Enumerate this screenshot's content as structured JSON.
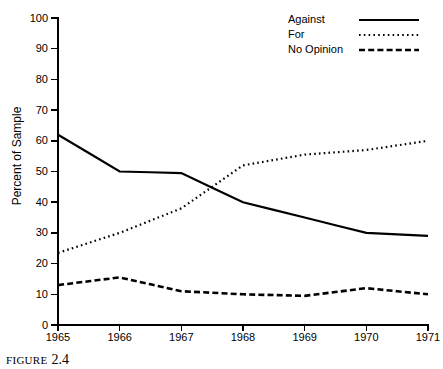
{
  "caption": {
    "word": "FIGURE",
    "number": "2.4"
  },
  "axes": {
    "ylabel": "Percent of Sample",
    "yticks": [
      "0",
      "10",
      "20",
      "30",
      "40",
      "50",
      "60",
      "70",
      "80",
      "90",
      "100"
    ],
    "xticks": [
      "1965",
      "1966",
      "1967",
      "1968",
      "1969",
      "1970",
      "1971"
    ]
  },
  "legend": {
    "items": [
      {
        "label": "Against",
        "style": "solid"
      },
      {
        "label": "For",
        "style": "dotted"
      },
      {
        "label": "No Opinion",
        "style": "dashed"
      }
    ]
  },
  "colors": {
    "ink": "#000000",
    "background": "#ffffff"
  },
  "chart_data": {
    "type": "line",
    "title": "",
    "xlabel": "",
    "ylabel": "Percent of Sample",
    "categories": [
      "1965",
      "1966",
      "1967",
      "1968",
      "1969",
      "1970",
      "1971"
    ],
    "x": [
      1965,
      1966,
      1967,
      1968,
      1969,
      1970,
      1971
    ],
    "xlim": [
      1965,
      1971
    ],
    "ylim": [
      0,
      100
    ],
    "ytick_step": 10,
    "grid": false,
    "legend_position": "top-right",
    "series": [
      {
        "name": "Against",
        "style": "solid",
        "values": [
          62,
          50,
          49.5,
          40,
          35,
          30,
          29
        ]
      },
      {
        "name": "For",
        "style": "dotted",
        "values": [
          23.5,
          30,
          38,
          52,
          55.5,
          57,
          60
        ]
      },
      {
        "name": "No Opinion",
        "style": "dashed",
        "values": [
          13,
          15.5,
          11,
          10,
          9.5,
          12,
          10
        ]
      }
    ]
  }
}
